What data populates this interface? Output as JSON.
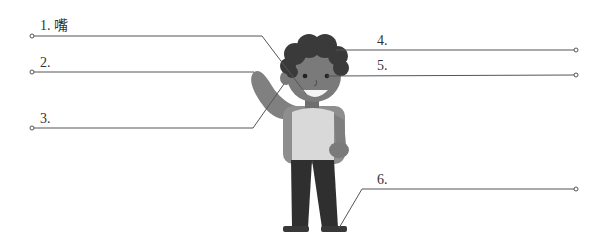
{
  "diagram": {
    "type": "labeled-figure",
    "labels": [
      {
        "id": 1,
        "number": "1.",
        "text": "嘴",
        "side": "left"
      },
      {
        "id": 2,
        "number": "2.",
        "text": "",
        "side": "left"
      },
      {
        "id": 3,
        "number": "3.",
        "text": "",
        "side": "left"
      },
      {
        "id": 4,
        "number": "4.",
        "text": "",
        "side": "right"
      },
      {
        "id": 5,
        "number": "5.",
        "text": "",
        "side": "right"
      },
      {
        "id": 6,
        "number": "6.",
        "text": "",
        "side": "right"
      }
    ],
    "colors": {
      "line": "#555555",
      "hair": "#3a3a3a",
      "skin": "#7a7a7a",
      "shirt": "#d9d9d9",
      "pants": "#2f2f2f",
      "backpack": "#8e8e8e"
    }
  }
}
